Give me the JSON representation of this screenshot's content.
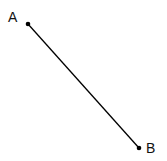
{
  "diagram": {
    "type": "line-segment",
    "points": [
      {
        "label": "A",
        "x": 28,
        "y": 24
      },
      {
        "label": "B",
        "x": 139,
        "y": 148
      }
    ],
    "segment": {
      "from": "A",
      "to": "B",
      "color": "#000000"
    }
  }
}
